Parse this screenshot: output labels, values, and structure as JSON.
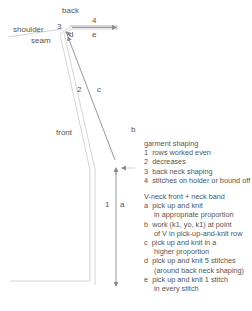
{
  "diagram": {
    "region_labels": {
      "back": "back",
      "shoulder": "shoulder",
      "seam": "seam",
      "front": "front"
    },
    "edge_labels": {
      "n1": "1",
      "n2": "2",
      "n3": "3",
      "n4": "4",
      "a": "a",
      "b": "b",
      "c": "c",
      "d": "d",
      "e": "e"
    },
    "colors": {
      "outline": "#c8c8c8",
      "arrow": "#8a8a8a",
      "text": "#555555"
    }
  },
  "legend": {
    "garment_title": "garment shaping",
    "garment_items": [
      {
        "key": "1",
        "text": "rows worked even"
      },
      {
        "key": "2",
        "text": "decreases"
      },
      {
        "key": "3",
        "text": "back neck shaping"
      },
      {
        "key": "4",
        "text": "stitches on holder or bound off"
      }
    ],
    "band_title": "V-neck front + neck band",
    "band_items": [
      {
        "key": "a",
        "line1": "pick up and knit",
        "line2": "in appropriate proportion"
      },
      {
        "key": "b",
        "line1": "work (k1, yo, k1) at point",
        "line2": "of V in pick-up-and-knit row"
      },
      {
        "key": "c",
        "line1": "pick up and knit in a",
        "line2": "higher proportion"
      },
      {
        "key": "d",
        "line1": "pick up and knit 5 stitches",
        "line2": "(around back neck shaping)"
      },
      {
        "key": "e",
        "line1": "pick up and knit 1 stitch",
        "line2": "in every stitch"
      }
    ]
  }
}
